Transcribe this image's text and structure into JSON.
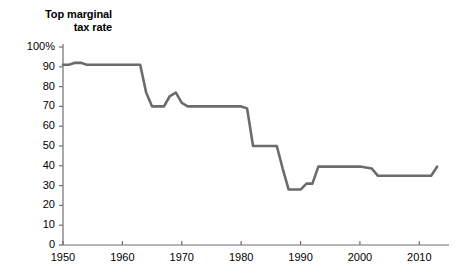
{
  "chart_data": {
    "type": "line",
    "title": "Top marginal tax rate",
    "title_lines": [
      "Top marginal",
      "tax rate"
    ],
    "xlabel": "",
    "ylabel": "Top marginal tax rate",
    "xlim": [
      1950,
      2015
    ],
    "ylim": [
      0,
      100
    ],
    "grid": false,
    "legend": "none",
    "line_color": "#6b6b6b",
    "axis_color": "#707070",
    "yticks": [
      0,
      10,
      20,
      30,
      40,
      50,
      60,
      70,
      80,
      90,
      100
    ],
    "ytick_labels": [
      "0",
      "10",
      "20",
      "30",
      "40",
      "50",
      "60",
      "70",
      "80",
      "90",
      "100%"
    ],
    "xticks": [
      1950,
      1960,
      1970,
      1980,
      1990,
      2000,
      2010
    ],
    "xtick_labels": [
      "1950",
      "1960",
      "1970",
      "1980",
      "1990",
      "2000",
      "2010"
    ],
    "series": [
      {
        "name": "Top marginal tax rate",
        "x": [
          1950,
          1951,
          1952,
          1953,
          1954,
          1955,
          1963,
          1964,
          1965,
          1967,
          1968,
          1969,
          1970,
          1971,
          1980,
          1981,
          1982,
          1986,
          1987,
          1988,
          1990,
          1991,
          1992,
          1993,
          2000,
          2001,
          2002,
          2003,
          2012,
          2013
        ],
        "values": [
          91,
          91,
          92,
          92,
          91,
          91,
          91,
          77,
          70,
          70,
          75.25,
          77,
          71.75,
          70,
          70,
          69,
          50,
          50,
          38.5,
          28,
          28,
          31,
          31,
          39.6,
          39.6,
          39.1,
          38.6,
          35,
          35,
          39.6
        ]
      }
    ]
  }
}
